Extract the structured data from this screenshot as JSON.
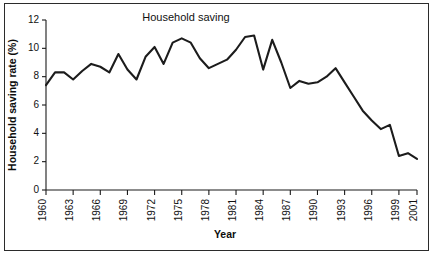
{
  "chart_data": {
    "type": "line",
    "title": "Household saving",
    "xlabel": "Year",
    "ylabel": "Household saving rate (%)",
    "xlim": [
      1960,
      2001
    ],
    "ylim": [
      0,
      12
    ],
    "ytick_values": [
      0,
      2,
      4,
      6,
      8,
      10,
      12
    ],
    "ytick_labels": [
      "0",
      "2",
      "4",
      "6",
      "8",
      "10",
      "12"
    ],
    "xtick_values": [
      1960,
      1963,
      1966,
      1969,
      1972,
      1975,
      1978,
      1981,
      1984,
      1987,
      1990,
      1993,
      1996,
      1999,
      2001
    ],
    "xtick_labels": [
      "1960",
      "1963",
      "1966",
      "1969",
      "1972",
      "1975",
      "1978",
      "1981",
      "1984",
      "1987",
      "1990",
      "1993",
      "1996",
      "1999",
      "2001"
    ],
    "grid": false,
    "legend": false,
    "line_color": "#1c1c1c",
    "x": [
      1960,
      1961,
      1962,
      1963,
      1964,
      1965,
      1966,
      1967,
      1968,
      1969,
      1970,
      1971,
      1972,
      1973,
      1974,
      1975,
      1976,
      1977,
      1978,
      1979,
      1980,
      1981,
      1982,
      1983,
      1984,
      1985,
      1986,
      1987,
      1988,
      1989,
      1990,
      1991,
      1992,
      1993,
      1994,
      1995,
      1996,
      1997,
      1998,
      1999,
      2000,
      2001
    ],
    "values": [
      7.4,
      8.3,
      8.3,
      7.8,
      8.4,
      8.9,
      8.7,
      8.3,
      9.6,
      8.5,
      7.8,
      9.4,
      10.1,
      8.9,
      10.4,
      10.7,
      10.4,
      9.3,
      8.6,
      8.9,
      9.2,
      9.9,
      10.8,
      10.9,
      8.5,
      10.6,
      9.0,
      7.2,
      7.7,
      7.5,
      7.6,
      8.0,
      8.6,
      7.6,
      6.6,
      5.6,
      4.9,
      4.3,
      4.6,
      2.4,
      2.6,
      2.2
    ],
    "series_name": "Household saving rate"
  }
}
